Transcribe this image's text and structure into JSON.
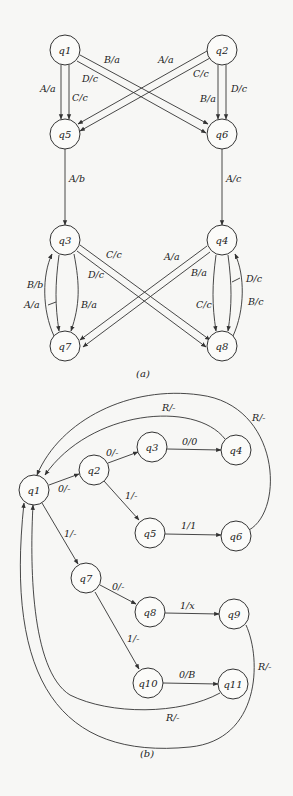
{
  "diagram_a": {
    "caption": "(a)",
    "nodes": [
      {
        "id": "q1",
        "label": "q1",
        "x": 65,
        "y": 50
      },
      {
        "id": "q2",
        "label": "q2",
        "x": 222,
        "y": 50
      },
      {
        "id": "q5",
        "label": "q5",
        "x": 65,
        "y": 134
      },
      {
        "id": "q6",
        "label": "q6",
        "x": 222,
        "y": 134
      },
      {
        "id": "q3",
        "label": "q3",
        "x": 65,
        "y": 240
      },
      {
        "id": "q4",
        "label": "q4",
        "x": 222,
        "y": 240
      },
      {
        "id": "q7",
        "label": "q7",
        "x": 65,
        "y": 346
      },
      {
        "id": "q8",
        "label": "q8",
        "x": 222,
        "y": 346
      }
    ],
    "edges": [
      {
        "from": "q1",
        "to": "q5",
        "label": "A/a"
      },
      {
        "from": "q1",
        "to": "q5",
        "label": "C/c"
      },
      {
        "from": "q1",
        "to": "q6",
        "label": "B/a"
      },
      {
        "from": "q1",
        "to": "q6",
        "label": "D/c"
      },
      {
        "from": "q2",
        "to": "q5",
        "label": "A/a"
      },
      {
        "from": "q2",
        "to": "q5",
        "label": "C/c"
      },
      {
        "from": "q2",
        "to": "q6",
        "label": "B/a"
      },
      {
        "from": "q2",
        "to": "q6",
        "label": "D/c"
      },
      {
        "from": "q5",
        "to": "q3",
        "label": "A/b"
      },
      {
        "from": "q6",
        "to": "q4",
        "label": "A/c"
      },
      {
        "from": "q3",
        "to": "q8",
        "label": "C/c"
      },
      {
        "from": "q3",
        "to": "q8",
        "label": "D/c"
      },
      {
        "from": "q3",
        "to": "q7",
        "label": "A/a"
      },
      {
        "from": "q3",
        "to": "q7",
        "label": "B/a"
      },
      {
        "from": "q7",
        "to": "q3",
        "label": "B/b"
      },
      {
        "from": "q4",
        "to": "q7",
        "label": "A/a"
      },
      {
        "from": "q4",
        "to": "q7",
        "label": "B/a"
      },
      {
        "from": "q4",
        "to": "q8",
        "label": "C/c"
      },
      {
        "from": "q4",
        "to": "q8",
        "label": "D/c"
      },
      {
        "from": "q8",
        "to": "q4",
        "label": "B/c"
      }
    ]
  },
  "diagram_b": {
    "caption": "(b)",
    "nodes": [
      {
        "id": "q1",
        "label": "q1",
        "x": 34,
        "y": 490
      },
      {
        "id": "q2",
        "label": "q2",
        "x": 94,
        "y": 470
      },
      {
        "id": "q3",
        "label": "q3",
        "x": 152,
        "y": 447
      },
      {
        "id": "q4",
        "label": "q4",
        "x": 236,
        "y": 450
      },
      {
        "id": "q5",
        "label": "q5",
        "x": 150,
        "y": 533
      },
      {
        "id": "q6",
        "label": "q6",
        "x": 236,
        "y": 536
      },
      {
        "id": "q7",
        "label": "q7",
        "x": 86,
        "y": 578
      },
      {
        "id": "q8",
        "label": "q8",
        "x": 150,
        "y": 612
      },
      {
        "id": "q9",
        "label": "q9",
        "x": 234,
        "y": 614
      },
      {
        "id": "q10",
        "label": "q10",
        "x": 148,
        "y": 683
      },
      {
        "id": "q11",
        "label": "q11",
        "x": 233,
        "y": 684
      }
    ],
    "edges": [
      {
        "from": "q1",
        "to": "q2",
        "label": "0/-"
      },
      {
        "from": "q2",
        "to": "q3",
        "label": "0/-"
      },
      {
        "from": "q3",
        "to": "q4",
        "label": "0/0"
      },
      {
        "from": "q2",
        "to": "q5",
        "label": "1/-"
      },
      {
        "from": "q5",
        "to": "q6",
        "label": "1/1"
      },
      {
        "from": "q1",
        "to": "q7",
        "label": "1/-"
      },
      {
        "from": "q7",
        "to": "q8",
        "label": "0/-"
      },
      {
        "from": "q8",
        "to": "q9",
        "label": "1/x"
      },
      {
        "from": "q7",
        "to": "q10",
        "label": "1/-"
      },
      {
        "from": "q10",
        "to": "q11",
        "label": "0/B"
      },
      {
        "from": "q4",
        "to": "q1",
        "label": "R/-"
      },
      {
        "from": "q6",
        "to": "q1",
        "label": "R/-"
      },
      {
        "from": "q9",
        "to": "q1",
        "label": "R/-"
      },
      {
        "from": "q11",
        "to": "q1",
        "label": "R/-"
      }
    ]
  }
}
